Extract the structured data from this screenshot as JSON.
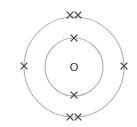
{
  "diagram": {
    "title": "",
    "nucleus": {
      "label": "O",
      "cx": 74,
      "cy": 67
    },
    "shells": [
      {
        "name": "inner",
        "radius": 29,
        "electron_count": 2
      },
      {
        "name": "outer",
        "radius": 50,
        "electron_count": 6
      }
    ],
    "electron_symbol": "×",
    "colors": {
      "shell": "#b8b8b8",
      "electron": "#555555",
      "nucleus": "#333333",
      "background": "#ffffff"
    }
  }
}
